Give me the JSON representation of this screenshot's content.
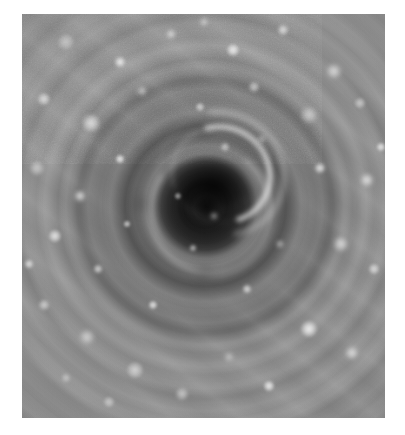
{
  "page": {
    "kind": "grayscale-planetary-image",
    "width": 405,
    "height": 435,
    "background_color": "#ffffff"
  },
  "plate": {
    "name": "polar-vortex-image",
    "left": 22,
    "top": 14,
    "width": 363,
    "height": 404,
    "colorspace": "grayscale",
    "base_color": "#8e8e8e"
  },
  "scene": {
    "subject": "cyclonic polar vortex viewed from directly above",
    "center_x_pct": 50.5,
    "center_y_pct": 47.5,
    "eye": {
      "name": "vortex-eye",
      "description": "dark central eye of the storm",
      "radius_px": 30,
      "darkest_color": "#0d0d0d"
    },
    "eyewall": {
      "name": "eyewall-ring",
      "description": "bright crescent cloud wall surrounding the eye, brightest toward upper right",
      "radius_px": 58,
      "highlight_color": "#e8e8e8"
    },
    "annulus": {
      "name": "dark-annulus",
      "description": "darker moat of subsiding air outside the eyewall",
      "inner_radius_px": 66,
      "outer_radius_px": 88,
      "color": "#585858"
    },
    "outer_field": {
      "name": "outer-cloud-field",
      "description": "mottled gray cloud deck with bright convective spots arranged on spiral arms",
      "color": "#959595"
    },
    "spiral_arms": {
      "name": "spiral-streaks",
      "angle_deg": 38,
      "count": 9
    }
  },
  "bright_spots": [
    {
      "x": 12,
      "y": 7,
      "r": 9
    },
    {
      "x": 27,
      "y": 12,
      "r": 6
    },
    {
      "x": 41,
      "y": 5,
      "r": 5
    },
    {
      "x": 58,
      "y": 9,
      "r": 7
    },
    {
      "x": 72,
      "y": 4,
      "r": 6
    },
    {
      "x": 86,
      "y": 14,
      "r": 8
    },
    {
      "x": 6,
      "y": 21,
      "r": 7
    },
    {
      "x": 19,
      "y": 27,
      "r": 10
    },
    {
      "x": 33,
      "y": 19,
      "r": 5
    },
    {
      "x": 49,
      "y": 23,
      "r": 5
    },
    {
      "x": 64,
      "y": 18,
      "r": 6
    },
    {
      "x": 79,
      "y": 25,
      "r": 9
    },
    {
      "x": 93,
      "y": 22,
      "r": 6
    },
    {
      "x": 4,
      "y": 38,
      "r": 8
    },
    {
      "x": 16,
      "y": 45,
      "r": 6
    },
    {
      "x": 27,
      "y": 36,
      "r": 5
    },
    {
      "x": 82,
      "y": 38,
      "r": 6
    },
    {
      "x": 95,
      "y": 41,
      "r": 7
    },
    {
      "x": 9,
      "y": 55,
      "r": 7
    },
    {
      "x": 21,
      "y": 63,
      "r": 5
    },
    {
      "x": 88,
      "y": 57,
      "r": 8
    },
    {
      "x": 97,
      "y": 63,
      "r": 6
    },
    {
      "x": 6,
      "y": 72,
      "r": 6
    },
    {
      "x": 18,
      "y": 80,
      "r": 8
    },
    {
      "x": 31,
      "y": 88,
      "r": 9
    },
    {
      "x": 44,
      "y": 94,
      "r": 7
    },
    {
      "x": 57,
      "y": 85,
      "r": 5
    },
    {
      "x": 68,
      "y": 92,
      "r": 6
    },
    {
      "x": 79,
      "y": 78,
      "r": 9
    },
    {
      "x": 91,
      "y": 84,
      "r": 7
    },
    {
      "x": 36,
      "y": 72,
      "r": 5
    },
    {
      "x": 62,
      "y": 68,
      "r": 5
    },
    {
      "x": 71,
      "y": 57,
      "r": 4
    },
    {
      "x": 29,
      "y": 52,
      "r": 4
    },
    {
      "x": 47,
      "y": 58,
      "r": 4
    },
    {
      "x": 53,
      "y": 50,
      "r": 4
    },
    {
      "x": 43,
      "y": 45,
      "r": 4
    },
    {
      "x": 56,
      "y": 33,
      "r": 5
    },
    {
      "x": 66,
      "y": 31,
      "r": 4
    },
    {
      "x": 24,
      "y": 96,
      "r": 6
    },
    {
      "x": 12,
      "y": 90,
      "r": 5
    },
    {
      "x": 50,
      "y": 2,
      "r": 4
    },
    {
      "x": 99,
      "y": 33,
      "r": 5
    },
    {
      "x": 2,
      "y": 62,
      "r": 5
    }
  ],
  "dark_spots": [
    {
      "x": 33,
      "y": 47,
      "r": 9
    },
    {
      "x": 63,
      "y": 44,
      "r": 8
    },
    {
      "x": 50,
      "y": 64,
      "r": 9
    },
    {
      "x": 50,
      "y": 30,
      "r": 7
    }
  ]
}
